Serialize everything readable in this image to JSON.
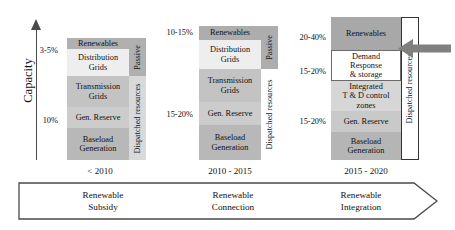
{
  "axis": {
    "label": "Capacity"
  },
  "colors": {
    "dark_gray": "#9e9e9e",
    "mid_gray": "#b4b4b4",
    "light_gray": "#cfcfcf",
    "pale_gray": "#dedede",
    "very_light": "#e9e9e9",
    "white": "#ffffff",
    "arrow_gray": "#808080",
    "outline": "#555555"
  },
  "columns": [
    {
      "id": "col-2010",
      "period": "< 2010",
      "era_label": "Renewable\nSubsidy",
      "ticks": [
        {
          "text": "3-5%"
        },
        {
          "text": "10%"
        }
      ],
      "bands": [
        {
          "name": "renewables",
          "label": "Renewables"
        },
        {
          "name": "distribution-grids",
          "label": "Distribution\nGrids"
        },
        {
          "name": "transmission-grids",
          "label": "Transmission\nGrids"
        },
        {
          "name": "gen-reserve",
          "label": "Gen. Reserve"
        },
        {
          "name": "baseload-generation",
          "label": "Baseload\nGeneration"
        }
      ],
      "side_labels": [
        {
          "name": "passive",
          "label": "Passive"
        },
        {
          "name": "dispatched-resources",
          "label": "Dispatched resources"
        }
      ]
    },
    {
      "id": "col-2010-2015",
      "period": "2010 - 2015",
      "era_label": "Renewable\nConnection",
      "ticks": [
        {
          "text": "10-15%"
        },
        {
          "text": "15-20%"
        }
      ],
      "bands": [
        {
          "name": "renewables",
          "label": "Renewables"
        },
        {
          "name": "distribution-grids",
          "label": "Distribution\nGrids"
        },
        {
          "name": "transmission-grids",
          "label": "Transmission\nGrids"
        },
        {
          "name": "gen-reserve",
          "label": "Gen. Reserve"
        },
        {
          "name": "baseload-generation",
          "label": "Baseload\nGeneration"
        }
      ],
      "side_labels": [
        {
          "name": "passive",
          "label": "Passive"
        },
        {
          "name": "dispatched-resources",
          "label": "Dispatched resources"
        }
      ]
    },
    {
      "id": "col-2015-2020",
      "period": "2015 - 2020",
      "era_label": "Renewable\nIntegration",
      "ticks": [
        {
          "text": "20-40%"
        },
        {
          "text": "15-20%"
        },
        {
          "text": "15-20%"
        }
      ],
      "bands": [
        {
          "name": "renewables",
          "label": "Renewables"
        },
        {
          "name": "demand-response-storage",
          "label": "Demand\nResponse\n& storage"
        },
        {
          "name": "integrated-td-control-zones",
          "label": "Integrated\nT & D control\nzones"
        },
        {
          "name": "gen-reserve",
          "label": "Gen. Reserve"
        },
        {
          "name": "baseload-generation",
          "label": "Baseload\nGeneration"
        }
      ],
      "side_labels": [
        {
          "name": "dispatched-resources",
          "label": "Dispatched resources"
        }
      ]
    }
  ],
  "timeline": {
    "stages": [
      {
        "line1": "Renewable",
        "line2": "Subsidy"
      },
      {
        "line1": "Renewable",
        "line2": "Connection"
      },
      {
        "line1": "Renewable",
        "line2": "Integration"
      }
    ]
  },
  "annotation_arrow": {
    "name": "emphasis-arrow",
    "direction": "left",
    "color": "#808080"
  }
}
